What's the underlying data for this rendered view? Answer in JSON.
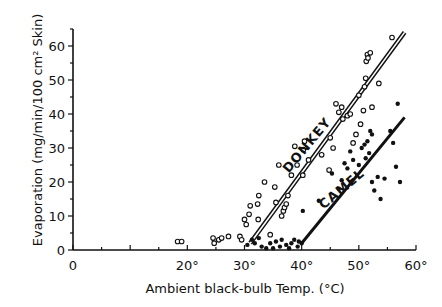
{
  "chart_data": {
    "type": "scatter",
    "title": "",
    "xlabel": "Ambient black-bulb Temp. (°C)",
    "ylabel": "Evaporation (mg/min/100 cm² Skin)",
    "xlim": [
      0,
      60
    ],
    "ylim": [
      0,
      65
    ],
    "xticks": [
      0,
      10,
      20,
      30,
      40,
      50,
      60
    ],
    "xtick_labels": [
      "0",
      "",
      "20°",
      "30°",
      "40°",
      "50°",
      "60°"
    ],
    "yticks": [
      0,
      10,
      20,
      30,
      40,
      50,
      60
    ],
    "ytick_labels": [
      "0",
      "10",
      "20",
      "30",
      "40",
      "50",
      "60"
    ],
    "grid": false,
    "legend": "inline line labels",
    "series": [
      {
        "name": "DONKEY",
        "marker": "open-circle",
        "points": [
          [
            18.3,
            2.5
          ],
          [
            19.0,
            2.5
          ],
          [
            24.5,
            3.5
          ],
          [
            24.7,
            2.0
          ],
          [
            25.5,
            3.0
          ],
          [
            26.0,
            3.5
          ],
          [
            27.2,
            4.0
          ],
          [
            29.2,
            4.0
          ],
          [
            29.5,
            3.0
          ],
          [
            30.0,
            9.0
          ],
          [
            30.3,
            7.5
          ],
          [
            30.8,
            10.5
          ],
          [
            31.0,
            13.0
          ],
          [
            32.3,
            13.5
          ],
          [
            32.4,
            9.0
          ],
          [
            32.5,
            16.0
          ],
          [
            33.5,
            20.0
          ],
          [
            34.5,
            4.5
          ],
          [
            35.5,
            14.0
          ],
          [
            35.3,
            18.5
          ],
          [
            36.0,
            25.0
          ],
          [
            36.5,
            10.0
          ],
          [
            36.8,
            11.5
          ],
          [
            37.0,
            12.5
          ],
          [
            37.3,
            13.5
          ],
          [
            37.6,
            16.0
          ],
          [
            38.2,
            22.0
          ],
          [
            38.8,
            30.5
          ],
          [
            39.2,
            25.0
          ],
          [
            40.2,
            22.0
          ],
          [
            40.3,
            29.5
          ],
          [
            40.5,
            32.0
          ],
          [
            41.2,
            26.5
          ],
          [
            43.5,
            28.0
          ],
          [
            44.8,
            23.5
          ],
          [
            45.0,
            33.0
          ],
          [
            45.5,
            30.0
          ],
          [
            46.0,
            43.0
          ],
          [
            46.5,
            40.5
          ],
          [
            47.0,
            42.0
          ],
          [
            47.2,
            38.5
          ],
          [
            48.0,
            39.5
          ],
          [
            48.5,
            40.0
          ],
          [
            49.0,
            31.5
          ],
          [
            49.5,
            34.0
          ],
          [
            50.0,
            45.5
          ],
          [
            50.3,
            37.0
          ],
          [
            50.8,
            41.0
          ],
          [
            51.0,
            48.0
          ],
          [
            51.2,
            50.5
          ],
          [
            51.3,
            55.5
          ],
          [
            51.5,
            57.5
          ],
          [
            51.6,
            56.5
          ],
          [
            52.0,
            58.0
          ],
          [
            52.3,
            42.0
          ],
          [
            53.5,
            49.0
          ],
          [
            55.8,
            62.5
          ]
        ],
        "fit_line": {
          "x": [
            31.0,
            58.0
          ],
          "y": [
            2.0,
            64.0
          ]
        }
      },
      {
        "name": "CAMEL",
        "marker": "filled-circle",
        "points": [
          [
            30.5,
            1.5
          ],
          [
            31.3,
            3.0
          ],
          [
            31.8,
            2.0
          ],
          [
            32.5,
            3.5
          ],
          [
            33.0,
            1.0
          ],
          [
            33.8,
            0.5
          ],
          [
            34.5,
            2.0
          ],
          [
            35.0,
            0.5
          ],
          [
            35.5,
            2.5
          ],
          [
            36.2,
            1.0
          ],
          [
            36.5,
            3.0
          ],
          [
            37.3,
            1.5
          ],
          [
            37.8,
            0.5
          ],
          [
            38.2,
            2.0
          ],
          [
            38.7,
            3.0
          ],
          [
            39.3,
            1.0
          ],
          [
            39.5,
            2.5
          ],
          [
            40.0,
            2.0
          ],
          [
            40.2,
            11.5
          ],
          [
            43.0,
            14.5
          ],
          [
            45.3,
            22.5
          ],
          [
            47.0,
            20.5
          ],
          [
            48.0,
            24.0
          ],
          [
            46.5,
            18.0
          ],
          [
            47.5,
            25.5
          ],
          [
            48.5,
            29.0
          ],
          [
            49.0,
            26.5
          ],
          [
            50.0,
            25.0
          ],
          [
            50.5,
            30.0
          ],
          [
            51.0,
            31.0
          ],
          [
            51.2,
            27.0
          ],
          [
            51.5,
            32.0
          ],
          [
            51.8,
            28.5
          ],
          [
            52.3,
            34.0
          ],
          [
            52.0,
            35.0
          ],
          [
            52.3,
            20.0
          ],
          [
            52.7,
            17.5
          ],
          [
            53.3,
            21.5
          ],
          [
            53.8,
            15.0
          ],
          [
            54.5,
            21.0
          ],
          [
            55.5,
            35.0
          ],
          [
            56.0,
            31.5
          ],
          [
            56.5,
            24.5
          ],
          [
            56.8,
            43.0
          ],
          [
            57.2,
            20.0
          ]
        ],
        "fit_line": {
          "x": [
            40.0,
            58.0
          ],
          "y": [
            2.0,
            39.0
          ]
        }
      }
    ],
    "annotations": [
      {
        "text": "DONKEY",
        "x": 41.5,
        "y": 30,
        "rotation": -50
      },
      {
        "text": "CAMEL",
        "x": 47.5,
        "y": 17,
        "rotation": -40
      }
    ]
  },
  "labels": {
    "xlabel": "Ambient black-bulb Temp. (°C)",
    "ylabel": "Evaporation (mg/min/100 cm² Skin)",
    "donkey": "DONKEY",
    "camel": "CAMEL"
  }
}
